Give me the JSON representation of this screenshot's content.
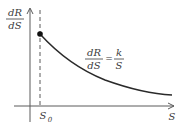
{
  "diagram": {
    "type": "function-plot",
    "y_axis_label": {
      "numerator": "dR",
      "denominator": "dS"
    },
    "x_axis_label": "S",
    "marker_label": {
      "base": "S",
      "subscript": "0"
    },
    "equation": {
      "lhs_numerator": "dR",
      "lhs_denominator": "dS",
      "operator": "=",
      "rhs_numerator": "k",
      "rhs_denominator": "S"
    },
    "curve": "dR/dS = k/S, decreasing hyperbola starting at S0",
    "colors": {
      "axis": "#5a5a5a",
      "curve": "#2a2a2a",
      "text": "#3a3a3a"
    }
  }
}
